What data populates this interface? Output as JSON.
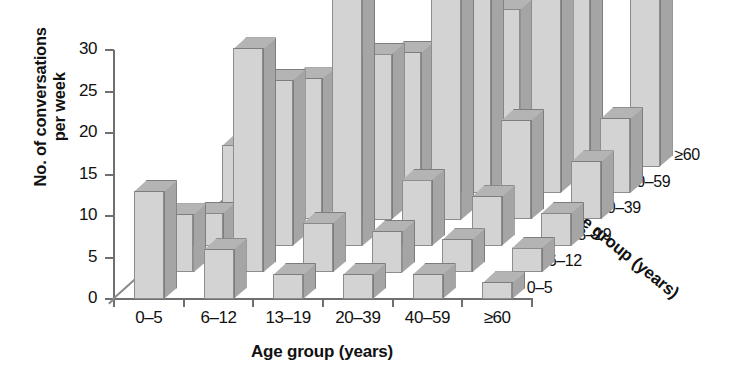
{
  "chart_data": {
    "type": "bar",
    "subtype": "3d-grouped-bar",
    "title": "",
    "xlabel": "Age group (years)",
    "ylabel": "No. of conversations\nper week",
    "zlabel": "Age group (years)",
    "ylim": [
      0,
      30
    ],
    "yticks": [
      0,
      5,
      10,
      15,
      20,
      25,
      30
    ],
    "grid": false,
    "legend": "none",
    "categories": [
      "0–5",
      "6–12",
      "13–19",
      "20–39",
      "40–59",
      "≥60"
    ],
    "depth_categories": [
      "0–5",
      "6–12",
      "13–19",
      "20–39",
      "40–59",
      "≥60"
    ],
    "series": [
      {
        "name": "0–5",
        "values": [
          13,
          6,
          3,
          3,
          3,
          2
        ]
      },
      {
        "name": "6–12",
        "values": [
          7,
          27,
          6,
          5,
          4,
          3
        ]
      },
      {
        "name": "13–19",
        "values": [
          4,
          20,
          31,
          8,
          6,
          4
        ]
      },
      {
        "name": "20–39",
        "values": [
          9,
          17,
          20,
          33,
          12,
          7
        ]
      },
      {
        "name": "40–59",
        "values": [
          6,
          12,
          17,
          26,
          25,
          9
        ]
      },
      {
        "name": "≥60",
        "values": [
          5,
          8,
          11,
          19,
          21,
          23
        ]
      }
    ]
  },
  "axis": {
    "y": {
      "label_line1": "No. of conversations",
      "label_line2": "per week",
      "ticks": [
        "0",
        "5",
        "10",
        "15",
        "20",
        "25",
        "30"
      ]
    },
    "x": {
      "label": "Age group (years)",
      "ticks": [
        "0–5",
        "6–12",
        "13–19",
        "20–39",
        "40–59",
        "≥60"
      ]
    },
    "z": {
      "label": "Age group (years)",
      "ticks": [
        "0–5",
        "6–12",
        "13–19",
        "20–39",
        "40–59",
        "≥60"
      ]
    }
  },
  "colors": {
    "bar_face": "#d3d3d3",
    "bar_top": "#b4b4b4",
    "bar_side": "#a5a5a5",
    "axis": "#6f6f6f",
    "text": "#111111",
    "background": "#ffffff"
  }
}
